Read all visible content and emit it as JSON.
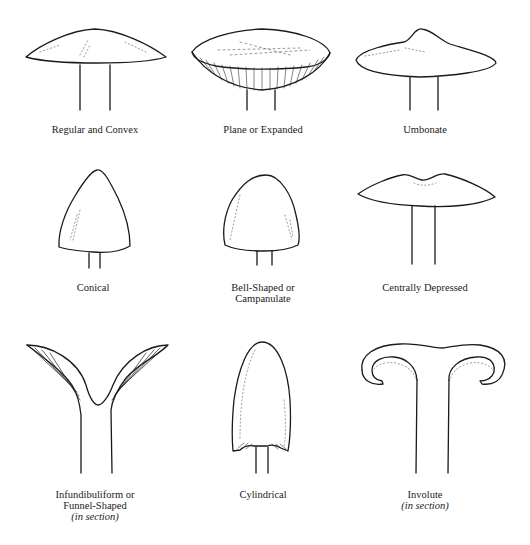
{
  "figure": {
    "shapes": [
      {
        "id": "regular-convex",
        "lines": [
          "Regular and Convex"
        ]
      },
      {
        "id": "plane-expanded",
        "lines": [
          "Plane or Expanded"
        ]
      },
      {
        "id": "umbonate",
        "lines": [
          "Umbonate"
        ]
      },
      {
        "id": "conical",
        "lines": [
          "Conical"
        ]
      },
      {
        "id": "bell-shaped",
        "lines": [
          "Bell-Shaped or",
          "Campanulate"
        ]
      },
      {
        "id": "centrally-depressed",
        "lines": [
          "Centrally Depressed"
        ]
      },
      {
        "id": "infundibuliform",
        "lines": [
          "Infundibuliform or",
          "Funnel-Shaped"
        ],
        "note": "(in section)"
      },
      {
        "id": "cylindrical",
        "lines": [
          "Cylindrical"
        ]
      },
      {
        "id": "involute",
        "lines": [
          "Involute"
        ],
        "note": "(in section)"
      }
    ]
  },
  "style": {
    "ink": "#1a1a1a",
    "background": "#ffffff"
  }
}
